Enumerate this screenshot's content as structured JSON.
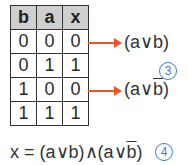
{
  "table": {
    "headers": [
      "b",
      "a",
      "x"
    ],
    "rows": [
      [
        "0",
        "0",
        "0"
      ],
      [
        "0",
        "1",
        "1"
      ],
      [
        "1",
        "0",
        "0"
      ],
      [
        "1",
        "1",
        "1"
      ]
    ]
  },
  "annotations": {
    "row1_expr": "(a∨b)",
    "row3_expr_prefix": "(a∨",
    "row3_expr_bar": "b",
    "row3_expr_suffix": ")",
    "marker_3": "3",
    "marker_4": "4"
  },
  "formula": {
    "prefix": "x = (a∨b)∧(a∨",
    "bar": "b",
    "suffix": ")"
  },
  "colors": {
    "arrow": "#e8542a",
    "marker": "#3a7bd5",
    "header_bg": "#cfcfcf"
  }
}
